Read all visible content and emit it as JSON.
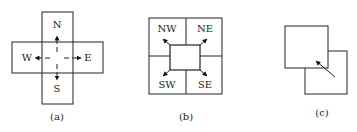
{
  "panels": [
    {
      "id": "a",
      "caption": "(a)",
      "labels": {
        "north": "N",
        "south": "S",
        "west": "W",
        "east": "E"
      }
    },
    {
      "id": "b",
      "caption": "(b)",
      "labels": {
        "nw": "NW",
        "ne": "NE",
        "sw": "SW",
        "se": "SE"
      }
    },
    {
      "id": "c",
      "caption": "(c)"
    }
  ],
  "colors": {
    "stroke": "#222222",
    "background": "#ffffff"
  }
}
